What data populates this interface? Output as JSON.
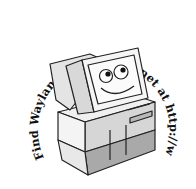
{
  "illustration": {
    "caption_text": "Find Wayland on the Internet at http://www.wayland.co.uk",
    "subject": "cartoon-computer-with-smiling-face",
    "colors": {
      "outline": "#222222",
      "light_face": "#f2f2f2",
      "mid_face": "#d9d9d9",
      "dark_face": "#a8a8a8",
      "screen": "#f7f7f7"
    }
  }
}
